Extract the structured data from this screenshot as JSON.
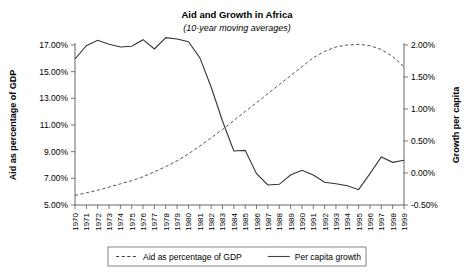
{
  "chart_data": {
    "type": "line",
    "title": "Aid and Growth in Africa",
    "subtitle": "(10-year moving averages)",
    "xlabel": "",
    "ylabel": "Aid as percentage of GDP",
    "y2label": "Growth per capita",
    "grid": false,
    "legend_position": "bottom",
    "x": [
      1970,
      1971,
      1972,
      1973,
      1974,
      1975,
      1976,
      1977,
      1978,
      1979,
      1980,
      1981,
      1982,
      1983,
      1984,
      1985,
      1986,
      1987,
      1988,
      1989,
      1990,
      1991,
      1992,
      1993,
      1994,
      1995,
      1996,
      1997,
      1998,
      1999
    ],
    "xtick_labels": [
      "1970",
      "1971",
      "1972",
      "1973",
      "1974",
      "1975",
      "1976",
      "1977",
      "1978",
      "1979",
      "1980",
      "1981",
      "1982",
      "1983",
      "1984",
      "1985",
      "1986",
      "1987",
      "1988",
      "1989",
      "1990",
      "1991",
      "1992",
      "1993",
      "1994",
      "1995",
      "1996",
      "1997",
      "1998",
      "1999"
    ],
    "ylim": [
      5.0,
      17.0
    ],
    "ytick_labels": [
      "5.00%",
      "7.00%",
      "9.00%",
      "11.00%",
      "13.00%",
      "15.00%",
      "17.00%"
    ],
    "yticks": [
      5.0,
      7.0,
      9.0,
      11.0,
      13.0,
      15.0,
      17.0
    ],
    "y2lim": [
      -0.5,
      2.0
    ],
    "y2tick_labels": [
      "-0.50%",
      "0.00%",
      "0.50%",
      "1.00%",
      "1.50%",
      "2.00%"
    ],
    "y2ticks": [
      -0.5,
      0.0,
      0.5,
      1.0,
      1.5,
      2.0
    ],
    "series": [
      {
        "name": "Aid as percentage of GDP",
        "axis": "right",
        "style": "dashed",
        "color": "#555555",
        "values": [
          -0.35,
          -0.31,
          -0.27,
          -0.22,
          -0.17,
          -0.12,
          -0.06,
          0.02,
          0.1,
          0.19,
          0.3,
          0.42,
          0.55,
          0.68,
          0.82,
          0.96,
          1.1,
          1.24,
          1.38,
          1.52,
          1.66,
          1.8,
          1.9,
          1.97,
          2.0,
          2.01,
          1.99,
          1.93,
          1.82,
          1.66
        ]
      },
      {
        "name": "Per capita growth",
        "axis": "left",
        "style": "solid",
        "color": "#333333",
        "values": [
          15.95,
          16.95,
          17.35,
          17.05,
          16.85,
          16.9,
          17.4,
          16.7,
          17.55,
          17.45,
          17.25,
          16.05,
          13.85,
          11.3,
          9.05,
          9.1,
          7.35,
          6.5,
          6.55,
          7.25,
          7.6,
          7.25,
          6.7,
          6.6,
          6.45,
          6.15,
          7.35,
          8.6,
          8.2,
          8.35
        ]
      }
    ],
    "legend": [
      {
        "label": "Aid as percentage of GDP",
        "style": "dashed"
      },
      {
        "label": "Per capita growth",
        "style": "solid"
      }
    ]
  }
}
